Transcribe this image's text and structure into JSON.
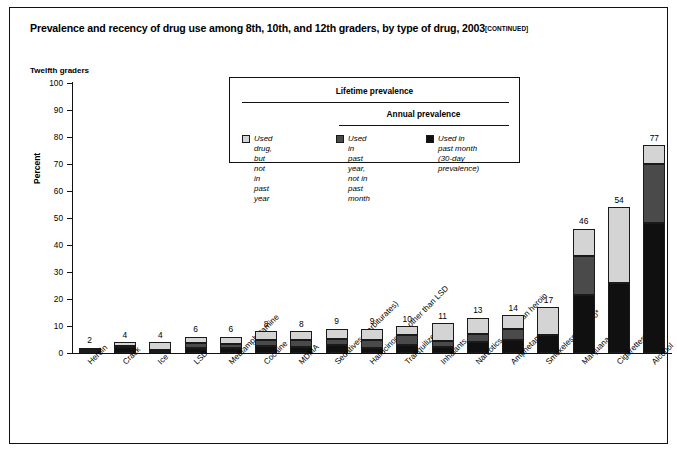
{
  "title": {
    "main": "Prevalence and recency of drug use among 8th, 10th, and 12th graders, by type of drug, 2003",
    "continued": "[CONTINUED]"
  },
  "subtitle": "Twelfth graders",
  "legend": {
    "header_lifetime": "Lifetime prevalence",
    "header_annual": "Annual prevalence",
    "items": [
      {
        "label": "Used drug, but not\nin past year",
        "color": "#d4d4d4"
      },
      {
        "label": "Used in past year,\nnot in past month",
        "color": "#4a4a4a"
      },
      {
        "label": "Used in past month\n(30-day prevalence)",
        "color": "#101010"
      }
    ]
  },
  "chart_data": {
    "type": "bar",
    "stacked": true,
    "title": "Prevalence and recency of drug use among 8th, 10th, and 12th graders, by type of drug, 2003",
    "subtitle": "Twelfth graders",
    "xlabel": "",
    "ylabel": "Percent",
    "ylim": [
      0,
      100
    ],
    "yticks": [
      0,
      10,
      20,
      30,
      40,
      50,
      60,
      70,
      80,
      90,
      100
    ],
    "grid": false,
    "legend_position": "inside-top-center",
    "categories": [
      "Heroin",
      "Crack",
      "Ice",
      "LSD",
      "Methamphetamine",
      "Cocaine",
      "MDMA",
      "Sedatives (barbiturates)",
      "Hallucinogens other than LSD",
      "Tranquilizers",
      "Inhalants",
      "Narcotics other than heroin",
      "Amphetamines",
      "Smokeless tobacco*",
      "Marijuana",
      "Cigarettes*",
      "Alcohol"
    ],
    "totals": [
      2,
      4,
      4,
      6,
      6,
      8,
      8,
      9,
      9,
      10,
      11,
      13,
      14,
      17,
      46,
      54,
      77
    ],
    "series": [
      {
        "name": "Used in past month (30-day prevalence)",
        "color": "#101010",
        "values": [
          0.5,
          2.2,
          0.6,
          1.9,
          1.7,
          2.5,
          2.1,
          2.9,
          1.8,
          2.9,
          2.4,
          4.1,
          5.0,
          6.7,
          21.5,
          26.0,
          48.0
        ]
      },
      {
        "name": "Used in past year, not in past month",
        "color": "#4a4a4a",
        "values": [
          0.5,
          0.4,
          0.4,
          1.8,
          1.6,
          2.5,
          2.6,
          2.3,
          2.9,
          3.6,
          1.9,
          2.9,
          4.0,
          0.0,
          14.5,
          0.0,
          22.0
        ]
      },
      {
        "name": "Used drug, but not in past year",
        "color": "#d4d4d4",
        "values": [
          1.0,
          1.4,
          3.0,
          2.3,
          2.7,
          3.0,
          3.3,
          3.8,
          4.3,
          3.5,
          6.7,
          6.0,
          5.0,
          10.3,
          10.0,
          28.0,
          7.0
        ]
      }
    ],
    "value_labels": [
      "2",
      "4",
      "4",
      "6",
      "6",
      "8",
      "8",
      "9",
      "9",
      "10",
      "11",
      "13",
      "14",
      "17",
      "46",
      "54",
      "77"
    ]
  }
}
